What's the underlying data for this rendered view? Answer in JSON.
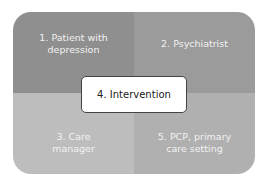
{
  "diagram": {
    "quadrants": [
      {
        "label": "1. Patient with depression",
        "color": "#8f8f8f"
      },
      {
        "label": "2. Psychiatrist",
        "color": "#9b9b9b"
      },
      {
        "label": "3. Care manager",
        "color": "#bdbdbd"
      },
      {
        "label": "5. PCP, primary care setting",
        "color": "#b0b0b0"
      }
    ],
    "center": {
      "label": "4. Intervention"
    }
  }
}
